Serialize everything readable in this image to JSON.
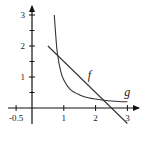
{
  "chart_data": {
    "type": "line",
    "title": "",
    "xlabel": "",
    "ylabel": "",
    "xlim": [
      -0.7,
      3.3
    ],
    "ylim": [
      -0.6,
      3.3
    ],
    "x_ticks": [
      -0.5,
      1,
      2,
      3
    ],
    "x_tick_labels": [
      "-0.5",
      "1",
      "2",
      "3"
    ],
    "y_ticks": [
      1,
      2,
      3
    ],
    "y_tick_labels": [
      "1",
      "2",
      "3"
    ],
    "y_minor_ticks": [
      0.5,
      1.5,
      2.5
    ],
    "grid": false,
    "series": [
      {
        "name": "f",
        "kind": "line",
        "x": [
          0.5,
          3.0
        ],
        "y": [
          2.0,
          -0.5
        ]
      },
      {
        "name": "g",
        "kind": "curve",
        "x": [
          0.7,
          0.75,
          0.8,
          0.9,
          1.0,
          1.2,
          1.5,
          1.8,
          2.2,
          2.6,
          3.0
        ],
        "y": [
          3.0,
          2.3,
          1.75,
          1.2,
          0.9,
          0.6,
          0.42,
          0.32,
          0.26,
          0.22,
          0.2
        ]
      }
    ],
    "annotations": [
      {
        "text": "f",
        "x": 1.75,
        "y": 0.95
      },
      {
        "text": "g",
        "x": 2.9,
        "y": 0.4
      }
    ]
  }
}
